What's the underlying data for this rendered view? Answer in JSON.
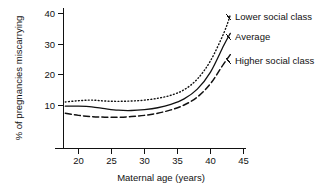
{
  "chart_data": {
    "type": "line",
    "title": "",
    "xlabel": "Maternal age (years)",
    "ylabel": "% of pregnancies miscarrying",
    "xlim": [
      16,
      46
    ],
    "ylim": [
      0,
      44
    ],
    "xticks": [
      20,
      25,
      30,
      35,
      40,
      45
    ],
    "yticks": [
      10,
      20,
      30,
      40
    ],
    "xtick_labels": [
      "20",
      "25",
      "30",
      "35",
      "40",
      "45"
    ],
    "ytick_labels": [
      "10",
      "20",
      "30",
      "40"
    ],
    "grid": false,
    "legend_position": "right-inline-annotations",
    "x": [
      18,
      20,
      22,
      24,
      26,
      28,
      30,
      32,
      34,
      36,
      38,
      40,
      42,
      43
    ],
    "series": [
      {
        "name": "Lower social class",
        "style": "dotted",
        "color": "#111111",
        "values": [
          11.0,
          11.4,
          11.6,
          11.3,
          11.2,
          11.3,
          11.6,
          12.2,
          13.2,
          15.0,
          18.5,
          24.5,
          33.5,
          39.5
        ]
      },
      {
        "name": "Average",
        "style": "solid",
        "color": "#111111",
        "values": [
          9.6,
          9.6,
          9.4,
          8.8,
          8.3,
          8.2,
          8.5,
          9.1,
          10.2,
          12.0,
          15.2,
          20.8,
          29.5,
          33.5
        ]
      },
      {
        "name": "Higher social class",
        "style": "dashed",
        "color": "#111111",
        "values": [
          7.3,
          6.6,
          6.2,
          6.0,
          6.0,
          6.2,
          6.6,
          7.3,
          8.4,
          10.0,
          12.6,
          17.0,
          23.5,
          26.5
        ]
      }
    ],
    "annotations": [
      {
        "label": "Lower social class",
        "x_px": 234,
        "y_px": 17
      },
      {
        "label": "Average",
        "x_px": 234,
        "y_px": 37
      },
      {
        "label": "Higher social class",
        "x_px": 234,
        "y_px": 61
      }
    ]
  },
  "axes": {
    "x_axis_name": "maternal-age-axis",
    "y_axis_name": "percent-miscarrying-axis"
  }
}
